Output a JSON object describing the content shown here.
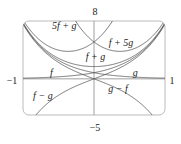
{
  "chart_data": {
    "type": "line",
    "title": "",
    "xlabel": "",
    "ylabel": "",
    "xlim": [
      -1,
      1
    ],
    "ylim": [
      -5,
      8
    ],
    "grid": false,
    "tick_labels": {
      "x_min": "−1",
      "x_max": "1",
      "y_min": "−5",
      "y_max": "8"
    },
    "model": {
      "f": "0.85*exp(2.2x)",
      "g": "0.85*exp(-2.2x)"
    },
    "series": [
      {
        "name": "f",
        "label": "f",
        "coef_f": 1,
        "coef_g": 0
      },
      {
        "name": "g",
        "label": "g",
        "coef_f": 0,
        "coef_g": 1
      },
      {
        "name": "f+g",
        "label": "f + g",
        "coef_f": 1,
        "coef_g": 1
      },
      {
        "name": "5f+g",
        "label": "5f + g",
        "coef_f": 5,
        "coef_g": 1
      },
      {
        "name": "f+5g",
        "label": "f + 5g",
        "coef_f": 1,
        "coef_g": 5
      },
      {
        "name": "f-g",
        "label": "f − g",
        "coef_f": 1,
        "coef_g": -1
      },
      {
        "name": "g-f",
        "label": "g − f",
        "coef_f": -1,
        "coef_g": 1
      }
    ],
    "annotations": [
      {
        "text": "5f + g",
        "x": -0.42,
        "y": 6.9
      },
      {
        "text": "f + 5g",
        "x": 0.38,
        "y": 4.6
      },
      {
        "text": "f + g",
        "x": 0.02,
        "y": 2.6
      },
      {
        "text": "f",
        "x": -0.6,
        "y": 0.4
      },
      {
        "text": "g",
        "x": 0.58,
        "y": 0.4
      },
      {
        "text": "f − g",
        "x": -0.72,
        "y": -2.8
      },
      {
        "text": "g − f",
        "x": 0.34,
        "y": -1.8
      }
    ]
  }
}
